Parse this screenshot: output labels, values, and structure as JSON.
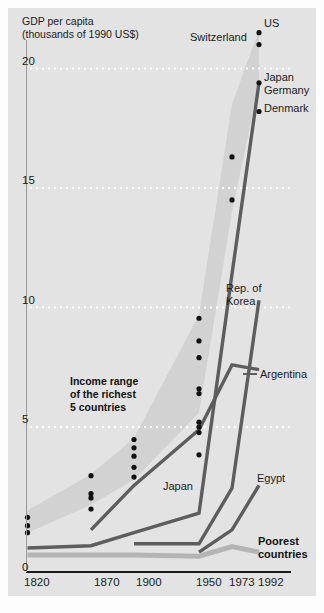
{
  "chart_data": {
    "type": "line",
    "title": "",
    "axis_title_lines": [
      "GDP per capita",
      "(thousands of 1990 US$)"
    ],
    "xlabel": "",
    "ylabel": "GDP per capita (thousands of 1990 US$)",
    "x_tick_labels": [
      "1820",
      "1870",
      "1900",
      "1950",
      "1973",
      "1992"
    ],
    "x_tick_values": [
      1820,
      1870,
      1900,
      1950,
      1973,
      1992
    ],
    "y_tick_labels": [
      "0",
      "5",
      "10",
      "15",
      "20"
    ],
    "y_tick_values": [
      0,
      5,
      10,
      15,
      20
    ],
    "ylim": [
      0,
      22
    ],
    "xlim": [
      1820,
      1992
    ],
    "grid": "horizontal dotted white gridlines at 5, 10, 15, 20",
    "legend_position": "inline end-of-line labels",
    "annotations": [
      {
        "name": "income-range-annotation",
        "lines": [
          "Income range",
          "of the richest",
          "5 countries"
        ]
      }
    ],
    "band": {
      "name": "Income range of the richest 5 countries",
      "color": "#d2d2d2",
      "upper": [
        {
          "x": 1820,
          "y": 2.0
        },
        {
          "x": 1870,
          "y": 3.3
        },
        {
          "x": 1900,
          "y": 4.6
        },
        {
          "x": 1950,
          "y": 9.7
        },
        {
          "x": 1973,
          "y": 18.5
        },
        {
          "x": 1992,
          "y": 21.6
        }
      ],
      "lower": [
        {
          "x": 1820,
          "y": 1.2
        },
        {
          "x": 1870,
          "y": 2.2
        },
        {
          "x": 1900,
          "y": 3.1
        },
        {
          "x": 1950,
          "y": 5.6
        },
        {
          "x": 1973,
          "y": 14.0
        },
        {
          "x": 1992,
          "y": 19.4
        }
      ]
    },
    "scatter_label": "Richest 5 countries data points",
    "scatter": [
      {
        "x": 1820,
        "y": 1.75
      },
      {
        "x": 1820,
        "y": 1.45
      },
      {
        "x": 1820,
        "y": 1.2
      },
      {
        "x": 1870,
        "y": 3.25
      },
      {
        "x": 1870,
        "y": 2.6
      },
      {
        "x": 1870,
        "y": 2.45
      },
      {
        "x": 1870,
        "y": 2.05
      },
      {
        "x": 1900,
        "y": 4.55
      },
      {
        "x": 1900,
        "y": 4.25
      },
      {
        "x": 1900,
        "y": 3.95
      },
      {
        "x": 1900,
        "y": 3.55
      },
      {
        "x": 1900,
        "y": 3.2
      },
      {
        "x": 1950,
        "y": 9.55
      },
      {
        "x": 1950,
        "y": 8.6
      },
      {
        "x": 1950,
        "y": 7.9
      },
      {
        "x": 1950,
        "y": 6.6
      },
      {
        "x": 1950,
        "y": 6.4
      },
      {
        "x": 1950,
        "y": 5.2
      },
      {
        "x": 1950,
        "y": 5.0
      },
      {
        "x": 1950,
        "y": 4.8
      },
      {
        "x": 1950,
        "y": 4.0
      },
      {
        "x": 1973,
        "y": 16.3
      },
      {
        "x": 1973,
        "y": 14.5
      },
      {
        "x": 1992,
        "y": 21.5
      },
      {
        "x": 1992,
        "y": 21.0
      },
      {
        "x": 1992,
        "y": 19.4
      },
      {
        "x": 1992,
        "y": 18.2
      }
    ],
    "endpoint_labels": [
      {
        "name": "us-label",
        "text": "US",
        "x": 1992,
        "y": 21.5
      },
      {
        "name": "switzerland-label",
        "text": "Switzerland",
        "x": 1992,
        "y": 21.0
      },
      {
        "name": "japan-top-label",
        "text": "Japan",
        "x": 1992,
        "y": 19.4
      },
      {
        "name": "germany-label",
        "text": "Germany",
        "x": 1992,
        "y": 18.7
      },
      {
        "name": "denmark-label",
        "text": "Denmark",
        "x": 1992,
        "y": 18.2
      }
    ],
    "series": [
      {
        "name": "Rep. of Korea",
        "label": "Rep. of Korea",
        "color": "#5d5d5d",
        "values": [
          {
            "x": 1900,
            "y": 0.8
          },
          {
            "x": 1950,
            "y": 0.8
          },
          {
            "x": 1973,
            "y": 2.8
          },
          {
            "x": 1992,
            "y": 10.3
          }
        ]
      },
      {
        "name": "Argentina",
        "label": "Argentina",
        "color": "#5d5d5d",
        "values": [
          {
            "x": 1870,
            "y": 1.3
          },
          {
            "x": 1900,
            "y": 2.9
          },
          {
            "x": 1950,
            "y": 4.9
          },
          {
            "x": 1973,
            "y": 7.6
          },
          {
            "x": 1992,
            "y": 7.4
          }
        ]
      },
      {
        "name": "Japan",
        "label": "Japan",
        "color": "#5d5d5d",
        "values": [
          {
            "x": 1820,
            "y": 0.65
          },
          {
            "x": 1870,
            "y": 0.73
          },
          {
            "x": 1900,
            "y": 1.2
          },
          {
            "x": 1950,
            "y": 1.9
          },
          {
            "x": 1973,
            "y": 11.4
          },
          {
            "x": 1992,
            "y": 19.4
          }
        ]
      },
      {
        "name": "Egypt",
        "label": "Egypt",
        "color": "#5d5d5d",
        "values": [
          {
            "x": 1950,
            "y": 0.5
          },
          {
            "x": 1973,
            "y": 1.3
          },
          {
            "x": 1992,
            "y": 2.9
          }
        ]
      },
      {
        "name": "Poorest countries",
        "label": "Poorest countries",
        "color": "#b4b4b4",
        "values": [
          {
            "x": 1820,
            "y": 0.4
          },
          {
            "x": 1870,
            "y": 0.4
          },
          {
            "x": 1900,
            "y": 0.4
          },
          {
            "x": 1950,
            "y": 0.35
          },
          {
            "x": 1973,
            "y": 0.7
          },
          {
            "x": 1992,
            "y": 0.5
          }
        ]
      }
    ],
    "colors": {
      "panel_background": "#e3e3e3",
      "band": "#d2d2d2",
      "line_dark": "#5d5d5d",
      "line_light": "#b4b4b4",
      "gridline": "#ffffff",
      "axis": "#1b1b1b",
      "dot": "#111111"
    }
  }
}
